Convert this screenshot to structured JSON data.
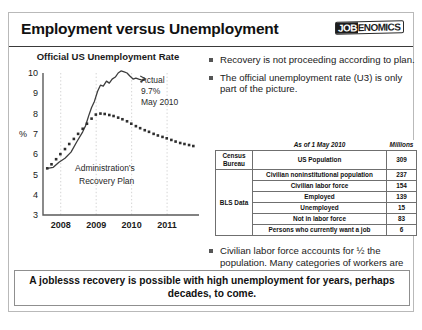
{
  "slide": {
    "title": "Employment versus Unemployment",
    "logo": {
      "dark_part": "JOB",
      "light_part": "ENOMICS"
    },
    "banner": "A joblesss recovery is possible with high unemployment for years, perhaps decades, to come."
  },
  "bullets_top": [
    "Recovery is not proceeding according to plan.",
    "The official unemployment rate (U3) is only part of the picture."
  ],
  "bullets_bottom": [
    "Civilian labor force accounts for ½ the population.  Many categories of workers are excluded."
  ],
  "table": {
    "meta_left": "As of 1 May 2010",
    "meta_right": "Millions",
    "rows": [
      {
        "source": "Census Bureau",
        "label": "US Population",
        "value": "309"
      },
      {
        "source": "BLS Data",
        "label": "Civilian noninstitutional population",
        "value": "237"
      },
      {
        "source": "",
        "label": "Civilian labor force",
        "value": "154"
      },
      {
        "source": "",
        "label": "Employed",
        "value": "139"
      },
      {
        "source": "",
        "label": "Unemployed",
        "value": "15"
      },
      {
        "source": "",
        "label": "Not in labor force",
        "value": "83"
      },
      {
        "source": "",
        "label": "Persons who currently want a job",
        "value": "6"
      }
    ],
    "source_census": "Census Bureau",
    "source_bls": "BLS Data"
  },
  "chart_data": {
    "type": "line",
    "title": "Official US Unemployment Rate",
    "xlabel": "",
    "ylabel": "%",
    "ylim": [
      3,
      10
    ],
    "yticks": [
      3,
      4,
      5,
      6,
      7,
      8,
      9,
      10
    ],
    "xlim": [
      2007.5,
      2011.9
    ],
    "xticks": [
      2008,
      2009,
      2010,
      2011
    ],
    "xtick_labels": [
      "2008",
      "2009",
      "2010",
      "2011"
    ],
    "grid": "vertical-dotted",
    "annotations": {
      "actual_label": "Actual",
      "actual_value": "9.7%",
      "actual_date": "May 2010",
      "plan_label_line1": "Administration’s",
      "plan_label_line2": "Recovery Plan"
    },
    "series": [
      {
        "name": "Actual",
        "style": "solid",
        "x": [
          2007.62,
          2007.79,
          2007.95,
          2008.12,
          2008.29,
          2008.45,
          2008.62,
          2008.7,
          2008.79,
          2008.87,
          2008.95,
          2009.04,
          2009.12,
          2009.2,
          2009.29,
          2009.37,
          2009.45,
          2009.54,
          2009.62,
          2009.7,
          2009.79,
          2009.87,
          2009.95,
          2010.04,
          2010.12,
          2010.2,
          2010.29,
          2010.37
        ],
        "y": [
          5.3,
          5.35,
          5.6,
          5.8,
          6.1,
          6.6,
          7.1,
          7.4,
          7.9,
          8.3,
          8.6,
          9.1,
          9.4,
          9.35,
          9.6,
          9.5,
          9.7,
          9.8,
          10.0,
          10.1,
          10.05,
          10.0,
          9.85,
          9.7,
          9.75,
          9.7,
          9.65,
          9.7
        ]
      },
      {
        "name": "Administration's Recovery Plan",
        "style": "dotted",
        "x": [
          2007.62,
          2007.74,
          2007.87,
          2007.99,
          2008.12,
          2008.24,
          2008.37,
          2008.49,
          2008.62,
          2008.74,
          2008.87,
          2008.99,
          2009.12,
          2009.24,
          2009.37,
          2009.49,
          2009.62,
          2009.74,
          2009.87,
          2009.99,
          2010.12,
          2010.24,
          2010.37,
          2010.49,
          2010.62,
          2010.74,
          2010.87,
          2010.99,
          2011.12,
          2011.24,
          2011.37,
          2011.49,
          2011.62,
          2011.74
        ],
        "y": [
          5.3,
          5.5,
          5.75,
          6.0,
          6.25,
          6.5,
          6.75,
          7.0,
          7.25,
          7.5,
          7.75,
          7.95,
          8.0,
          7.98,
          7.93,
          7.88,
          7.8,
          7.72,
          7.62,
          7.5,
          7.38,
          7.28,
          7.18,
          7.1,
          7.0,
          6.92,
          6.85,
          6.78,
          6.7,
          6.62,
          6.55,
          6.5,
          6.45,
          6.4
        ]
      }
    ]
  }
}
